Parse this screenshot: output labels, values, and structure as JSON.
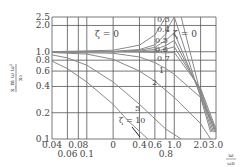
{
  "chart_data": {
    "type": "line",
    "title": "",
    "xlabel": "ω/ωn",
    "ylabel": "x_m ω ω² / x₀",
    "xscale": "log",
    "yscale": "log",
    "xlim": [
      0.04,
      3.0
    ],
    "ylim": [
      0.1,
      2.5
    ],
    "grid": true,
    "x_ticks": [
      {
        "value": 0.04,
        "label": "0.04",
        "row": 0
      },
      {
        "value": 0.06,
        "label": "0.06",
        "row": 1
      },
      {
        "value": 0.08,
        "label": "0.08",
        "row": 0
      },
      {
        "value": 0.1,
        "label": "0.1",
        "row": 1
      },
      {
        "value": 0.2,
        "label": "0",
        "row": 0
      },
      {
        "value": 0.4,
        "label": "0.4",
        "row": 0
      },
      {
        "value": 0.6,
        "label": "0.6",
        "row": 0
      },
      {
        "value": 0.8,
        "label": "0.8",
        "row": 1
      },
      {
        "value": 1.0,
        "label": "1.0",
        "row": 0
      },
      {
        "value": 2.0,
        "label": "2.0",
        "row": 0
      },
      {
        "value": 3.0,
        "label": "3.0",
        "row": 0
      }
    ],
    "y_ticks": [
      {
        "value": 0.1,
        "label": "0.1"
      },
      {
        "value": 0.2,
        "label": "0.2"
      },
      {
        "value": 0.4,
        "label": "0.4"
      },
      {
        "value": 0.6,
        "label": "0.6"
      },
      {
        "value": 0.8,
        "label": "0.8"
      },
      {
        "value": 1.0,
        "label": "1.0"
      },
      {
        "value": 2.0,
        "label": "2.0"
      },
      {
        "value": 2.5,
        "label": "2.5"
      }
    ],
    "series": [
      {
        "name": "ζ = 0.3",
        "x": [
          0.04,
          0.2,
          0.4,
          0.6,
          0.8,
          0.9,
          1.0,
          2.0,
          2.6
        ],
        "y": [
          1.0,
          1.01,
          1.06,
          1.2,
          1.6,
          2.1,
          2.5,
          0.3,
          0.12
        ]
      },
      {
        "name": "ζ = 0.4",
        "x": [
          0.04,
          0.2,
          0.4,
          0.6,
          0.8,
          1.0,
          2.0,
          2.7
        ],
        "y": [
          1.0,
          1.0,
          1.04,
          1.12,
          1.35,
          1.65,
          0.32,
          0.12
        ]
      },
      {
        "name": "ζ = 0.5",
        "x": [
          0.04,
          0.2,
          0.4,
          0.6,
          0.8,
          1.0,
          2.0,
          2.8
        ],
        "y": [
          1.0,
          1.0,
          1.02,
          1.06,
          1.18,
          1.35,
          0.35,
          0.12
        ]
      },
      {
        "name": "ζ = 0.6",
        "x": [
          0.04,
          0.2,
          0.4,
          0.6,
          0.8,
          1.0,
          2.0,
          2.9
        ],
        "y": [
          1.0,
          1.0,
          1.0,
          1.02,
          1.07,
          1.14,
          0.37,
          0.12
        ]
      },
      {
        "name": "ζ = 0.7",
        "x": [
          0.04,
          0.2,
          0.4,
          0.6,
          0.8,
          1.0,
          2.0,
          3.0
        ],
        "y": [
          1.0,
          1.0,
          0.99,
          0.98,
          0.97,
          0.98,
          0.38,
          0.13
        ]
      },
      {
        "name": "ζ = 1",
        "x": [
          0.04,
          0.2,
          0.4,
          0.6,
          0.8,
          1.0,
          2.0,
          3.0
        ],
        "y": [
          0.99,
          0.96,
          0.87,
          0.75,
          0.64,
          0.55,
          0.3,
          0.12
        ]
      },
      {
        "name": "ζ = 2",
        "x": [
          0.04,
          0.1,
          0.2,
          0.4,
          0.6,
          1.0,
          2.0,
          2.6
        ],
        "y": [
          0.98,
          0.94,
          0.82,
          0.6,
          0.46,
          0.3,
          0.15,
          0.1
        ]
      },
      {
        "name": "ζ = 5",
        "x": [
          0.04,
          0.06,
          0.1,
          0.2,
          0.4,
          0.8,
          1.2
        ],
        "y": [
          0.92,
          0.85,
          0.7,
          0.45,
          0.25,
          0.13,
          0.1
        ]
      },
      {
        "name": "ζ = 10",
        "x": [
          0.04,
          0.06,
          0.1,
          0.2,
          0.3,
          0.5
        ],
        "y": [
          0.78,
          0.64,
          0.45,
          0.25,
          0.16,
          0.1
        ]
      },
      {
        "name": "ζ = 0 (upper)",
        "x": [
          0.04,
          0.2,
          0.4,
          0.6,
          0.8
        ],
        "y": [
          1.0,
          1.04,
          1.19,
          1.56,
          2.5
        ]
      },
      {
        "name": "ζ = 0 (lower)",
        "x": [
          1.2,
          2.0,
          3.0
        ],
        "y": [
          2.5,
          0.33,
          0.125
        ]
      }
    ],
    "annotations": [
      {
        "text": "ζ = 0",
        "x": 0.3,
        "y": 1.55
      },
      {
        "text": "ζ = 0",
        "x": 1.45,
        "y": 1.55
      },
      {
        "text": "0.3",
        "x": 0.97,
        "y": 2.3
      },
      {
        "text": "0.4",
        "x": 0.97,
        "y": 1.55
      },
      {
        "text": "0.5",
        "x": 0.92,
        "y": 1.3
      },
      {
        "text": "0.6",
        "x": 0.92,
        "y": 1.1
      },
      {
        "text": "0.7",
        "x": 0.95,
        "y": 0.92
      },
      {
        "text": "1",
        "x": 0.9,
        "y": 0.7
      },
      {
        "text": "2",
        "x": 0.65,
        "y": 0.47
      },
      {
        "text": "5",
        "x": 0.42,
        "y": 0.22
      },
      {
        "text": "ζ = 10",
        "x": 0.35,
        "y": 0.175
      }
    ]
  },
  "axes": {
    "ylabel_top": "x_m ω ω²",
    "ylabel_bottom": "x₀",
    "xlabel_top": "ω",
    "xlabel_bottom": "ωn"
  },
  "labels": {
    "zeta0_left": "ζ = 0",
    "zeta0_right": "ζ = 0",
    "z03": "0.3",
    "z04": "0.4",
    "z05": "0.5",
    "z06": "0.6",
    "z07": "0.7",
    "z1": "1",
    "z2": "2",
    "z5": "5",
    "z10": "ζ = 10"
  }
}
